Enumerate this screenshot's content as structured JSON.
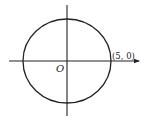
{
  "diagram": {
    "type": "coordinate-plane-circle",
    "origin_label": "O",
    "point_label": "(5, 0)",
    "circle": {
      "center": [
        0,
        0
      ],
      "radius": 5
    },
    "colors": {
      "stroke": "#222222",
      "background": "#ffffff"
    }
  }
}
